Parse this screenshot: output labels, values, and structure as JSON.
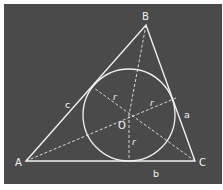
{
  "diagram": {
    "colors": {
      "background": "#4a4a4a",
      "stroke": "#f2f2f2"
    },
    "vertices": [
      {
        "id": "A",
        "label": "A"
      },
      {
        "id": "B",
        "label": "B"
      },
      {
        "id": "C",
        "label": "C"
      }
    ],
    "sides": [
      {
        "id": "a",
        "label": "a",
        "between": "B-C"
      },
      {
        "id": "b",
        "label": "b",
        "between": "A-C"
      },
      {
        "id": "c",
        "label": "c",
        "between": "A-B"
      }
    ],
    "center": {
      "label": "O"
    },
    "radius_labels": [
      "r",
      "r",
      "r"
    ],
    "lines": {
      "triangle": "solid",
      "incircle": "solid",
      "angle_bisectors": "dashed",
      "radius_to_base": "dashed"
    }
  }
}
